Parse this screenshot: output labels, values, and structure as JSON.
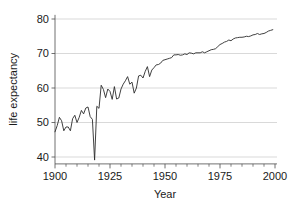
{
  "chart_data": {
    "type": "line",
    "title": "",
    "subtitle": "",
    "xlabel": "Year",
    "ylabel": "life expectancy",
    "xlim": [
      1900,
      2000
    ],
    "ylim": [
      38,
      81
    ],
    "x_ticks": [
      1900,
      1925,
      1950,
      1975,
      2000
    ],
    "x_tick_labels": [
      "1900",
      "1925",
      "1950",
      "1975",
      "2000"
    ],
    "x_minor_tick_interval": 5,
    "y_ticks": [
      40,
      50,
      60,
      70,
      80
    ],
    "y_tick_labels": [
      "40",
      "50",
      "60",
      "70",
      "80"
    ],
    "grid": "horizontal",
    "grid_color": "#c9c9c9",
    "legend": "none",
    "line_color": "#2b2b2b",
    "background_color": "#ffffff",
    "annotations": [],
    "x": [
      1900,
      1901,
      1902,
      1903,
      1904,
      1905,
      1906,
      1907,
      1908,
      1909,
      1910,
      1911,
      1912,
      1913,
      1914,
      1915,
      1916,
      1917,
      1918,
      1919,
      1920,
      1921,
      1922,
      1923,
      1924,
      1925,
      1926,
      1927,
      1928,
      1929,
      1930,
      1931,
      1932,
      1933,
      1934,
      1935,
      1936,
      1937,
      1938,
      1939,
      1940,
      1941,
      1942,
      1943,
      1944,
      1945,
      1946,
      1947,
      1948,
      1949,
      1950,
      1951,
      1952,
      1953,
      1954,
      1955,
      1956,
      1957,
      1958,
      1959,
      1960,
      1961,
      1962,
      1963,
      1964,
      1965,
      1966,
      1967,
      1968,
      1969,
      1970,
      1971,
      1972,
      1973,
      1974,
      1975,
      1976,
      1977,
      1978,
      1979,
      1980,
      1981,
      1982,
      1983,
      1984,
      1985,
      1986,
      1987,
      1988,
      1989,
      1990,
      1991,
      1992,
      1993,
      1994,
      1995,
      1996,
      1997,
      1998,
      1999
    ],
    "values": [
      47.3,
      49.1,
      51.5,
      50.5,
      47.6,
      48.7,
      48.7,
      47.6,
      51.1,
      52.1,
      50.0,
      51.5,
      53.5,
      52.5,
      54.2,
      54.5,
      51.7,
      50.9,
      39.1,
      54.7,
      54.1,
      60.8,
      59.6,
      57.2,
      59.7,
      59.0,
      56.7,
      60.4,
      56.8,
      57.1,
      59.7,
      61.1,
      62.1,
      63.3,
      61.1,
      61.7,
      58.5,
      60.0,
      63.5,
      63.7,
      62.9,
      64.8,
      66.2,
      63.3,
      65.2,
      65.9,
      66.7,
      66.8,
      67.2,
      68.0,
      68.2,
      68.4,
      68.6,
      68.8,
      69.6,
      69.6,
      69.7,
      69.5,
      69.6,
      69.9,
      69.7,
      70.2,
      70.1,
      69.9,
      70.2,
      70.2,
      70.2,
      70.5,
      70.2,
      70.5,
      70.8,
      71.1,
      71.2,
      71.4,
      72.0,
      72.6,
      72.9,
      73.3,
      73.5,
      73.9,
      73.7,
      74.2,
      74.5,
      74.6,
      74.7,
      74.7,
      74.8,
      75.0,
      74.9,
      75.1,
      75.4,
      75.5,
      75.8,
      75.5,
      75.7,
      75.8,
      76.1,
      76.5,
      76.7,
      76.9
    ]
  },
  "axes": {
    "x_title": "Year",
    "y_title": "life expectancy"
  }
}
